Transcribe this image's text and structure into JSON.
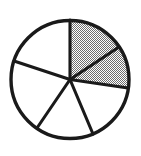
{
  "figure": {
    "type": "pie-chart-fraction-diagram",
    "background_color": "#ffffff",
    "outline_color": "#1a1a1a",
    "shaded_fill_color": "#a8a8a8",
    "unshaded_fill_color": "#ffffff",
    "geometry": {
      "center_x": 70,
      "center_y": 79.5,
      "radius": 59,
      "outline_stroke_width": 3.4,
      "spoke_stroke_width": 3.1
    }
  },
  "chart_data": {
    "type": "pie",
    "title": "",
    "xlabel": "",
    "ylabel": "",
    "legend_position": "none",
    "grid": false,
    "total_sectors": 6,
    "shaded_sectors": 2,
    "fraction_shaded": "2/6",
    "categories": [
      "sector-1",
      "sector-2",
      "sector-3",
      "sector-4",
      "sector-5",
      "sector-6"
    ],
    "values": [
      57,
      41,
      59,
      57,
      74,
      72
    ],
    "slices": [
      {
        "name": "sector-1",
        "shaded": true,
        "start_angle_deg": 90,
        "end_angle_deg": 33,
        "sweep_deg": 57,
        "fill": "#a8a8a8"
      },
      {
        "name": "sector-2",
        "shaded": true,
        "start_angle_deg": 33,
        "end_angle_deg": -8,
        "sweep_deg": 41,
        "fill": "#a8a8a8"
      },
      {
        "name": "sector-3",
        "shaded": false,
        "start_angle_deg": -8,
        "end_angle_deg": -67,
        "sweep_deg": 59,
        "fill": "#ffffff"
      },
      {
        "name": "sector-4",
        "shaded": false,
        "start_angle_deg": -67,
        "end_angle_deg": -124,
        "sweep_deg": 57,
        "fill": "#ffffff"
      },
      {
        "name": "sector-5",
        "shaded": false,
        "start_angle_deg": -124,
        "end_angle_deg": -198,
        "sweep_deg": 74,
        "fill": "#ffffff"
      },
      {
        "name": "sector-6",
        "shaded": false,
        "start_angle_deg": -198,
        "end_angle_deg": -270,
        "sweep_deg": 72,
        "fill": "#ffffff"
      }
    ],
    "spokes": [
      {
        "name": "spoke-top",
        "angle_deg": 90,
        "edge_x": 70,
        "edge_y": 20
      },
      {
        "name": "spoke-upper-right",
        "angle_deg": 33,
        "edge_x": 119,
        "edge_y": 47
      },
      {
        "name": "spoke-right",
        "angle_deg": -8,
        "edge_x": 128,
        "edge_y": 88
      },
      {
        "name": "spoke-lower-right",
        "angle_deg": -67,
        "edge_x": 93,
        "edge_y": 134
      },
      {
        "name": "spoke-lower-left",
        "angle_deg": -124,
        "edge_x": 37,
        "edge_y": 128
      },
      {
        "name": "spoke-left",
        "angle_deg": -198,
        "edge_x": 14,
        "edge_y": 61
      }
    ]
  }
}
